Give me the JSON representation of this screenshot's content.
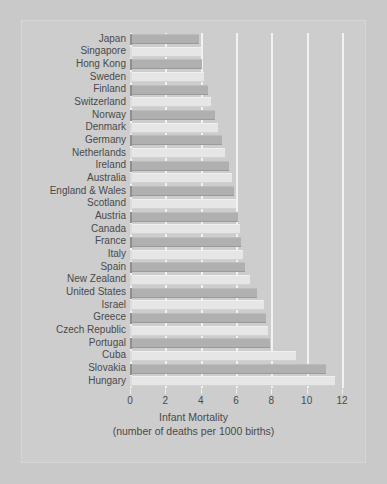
{
  "chart_data": {
    "type": "bar",
    "orientation": "horizontal",
    "title": "",
    "xlabel": "Infant Mortality",
    "xlabel_sub": "(number of deaths per 1000 births)",
    "ylabel": "",
    "xlim": [
      0,
      12
    ],
    "xticks": [
      0,
      2,
      4,
      6,
      8,
      10,
      12
    ],
    "xtick_labels": [
      "0",
      "2",
      "4",
      "6",
      "8",
      "10",
      "12"
    ],
    "grid": true,
    "grid_axis": "x",
    "legend": "none",
    "categories": [
      "Japan",
      "Singapore",
      "Hong Kong",
      "Sweden",
      "Finland",
      "Switzerland",
      "Norway",
      "Denmark",
      "Germany",
      "Netherlands",
      "Ireland",
      "Australia",
      "England & Wales",
      "Scotland",
      "Austria",
      "Canada",
      "France",
      "Italy",
      "Spain",
      "New Zealand",
      "United States",
      "Israel",
      "Greece",
      "Czech Republic",
      "Portugal",
      "Cuba",
      "Slovakia",
      "Hungary"
    ],
    "values": [
      3.9,
      4.0,
      4.1,
      4.2,
      4.4,
      4.6,
      4.8,
      5.0,
      5.2,
      5.4,
      5.6,
      5.8,
      5.9,
      6.0,
      6.1,
      6.2,
      6.3,
      6.4,
      6.5,
      6.8,
      7.2,
      7.6,
      7.7,
      7.8,
      7.9,
      9.4,
      11.1,
      11.6
    ],
    "colors": {
      "bar_dark": "#b0b0b0",
      "bar_light": "#e6e6e6",
      "background": "#c9c9c9",
      "panel": "#cdcdcd",
      "gridline": "#f2f2f2",
      "text": "#4a4a4a"
    }
  }
}
